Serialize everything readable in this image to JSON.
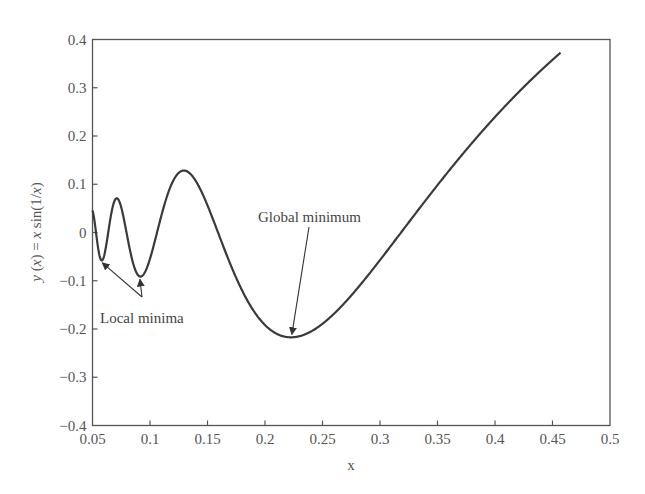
{
  "chart_data": {
    "type": "line",
    "title": "",
    "xlabel": "x",
    "ylabel": "y (x) = x sin(1/x)",
    "function": "y = x*sin(1/x)",
    "xlim": [
      0.05,
      0.5
    ],
    "ylim": [
      -0.4,
      0.4
    ],
    "grid": false,
    "legend": null,
    "x_ticks": [
      0.05,
      0.1,
      0.15,
      0.2,
      0.25,
      0.3,
      0.35,
      0.4,
      0.45,
      0.5
    ],
    "x_tick_labels": [
      "0.05",
      "0.1",
      "0.15",
      "0.2",
      "0.25",
      "0.3",
      "0.35",
      "0.4",
      "0.45",
      "0.5"
    ],
    "y_ticks": [
      0.4,
      0.3,
      0.2,
      0.1,
      0,
      -0.1,
      -0.2,
      -0.3,
      -0.4
    ],
    "y_tick_labels": [
      "0.4",
      "0.3",
      "0.2",
      "0.1",
      "0",
      "−0.1",
      "−0.2",
      "−0.3",
      "−0.4"
    ],
    "series": [
      {
        "name": "y(x) = x sin(1/x)",
        "x_range": [
          0.05,
          0.457
        ],
        "sample_points": [
          {
            "x": 0.05,
            "y": 0.046
          },
          {
            "x": 0.057,
            "y": -0.057
          },
          {
            "x": 0.069,
            "y": 0.068
          },
          {
            "x": 0.091,
            "y": -0.091
          },
          {
            "x": 0.129,
            "y": 0.128
          },
          {
            "x": 0.15,
            "y": 0.1
          },
          {
            "x": 0.2,
            "y": -0.192
          },
          {
            "x": 0.222,
            "y": -0.217
          },
          {
            "x": 0.25,
            "y": -0.189
          },
          {
            "x": 0.3,
            "y": -0.057
          },
          {
            "x": 0.35,
            "y": 0.098
          },
          {
            "x": 0.4,
            "y": 0.239
          },
          {
            "x": 0.457,
            "y": 0.373
          }
        ]
      }
    ],
    "annotations": [
      {
        "text": "Global minimum",
        "target": {
          "x": 0.2225,
          "y": -0.2172
        },
        "text_pos": {
          "x": 0.265,
          "y": 0.13
        }
      },
      {
        "text": "Local minima",
        "targets": [
          {
            "x": 0.0573,
            "y": -0.0568
          },
          {
            "x": 0.0913,
            "y": -0.0913
          }
        ],
        "text_pos": {
          "x": 0.059,
          "y": -0.215
        }
      }
    ]
  }
}
